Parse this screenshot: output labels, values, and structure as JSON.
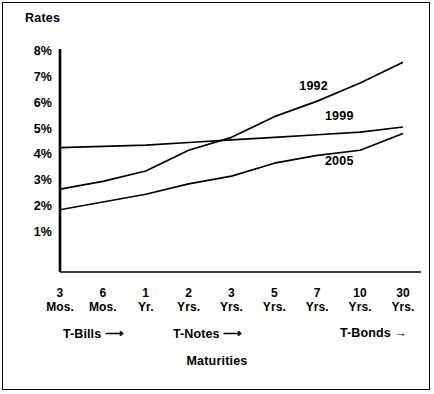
{
  "title": "YIELD CURVES FOR U.S. TREASURY SECURITIES",
  "axis": {
    "y_label": "Rates",
    "x_label": "Maturities"
  },
  "categories_markers": [
    {
      "label": "T-Bills",
      "arrow": "⟶"
    },
    {
      "label": "T-Notes",
      "arrow": "⟶"
    },
    {
      "label": "T-Bonds",
      "arrow": "→"
    }
  ],
  "chart_data": {
    "type": "line",
    "title": "YIELD CURVES FOR U.S. TREASURY SECURITIES",
    "xlabel": "Maturities",
    "ylabel": "Rates",
    "grid": false,
    "legend": "inline-labels",
    "categories": [
      "3 Mos.",
      "6 Mos.",
      "1 Yr.",
      "2 Yrs.",
      "3 Yrs.",
      "5 Yrs.",
      "7 Yrs.",
      "10 Yrs.",
      "30 Yrs."
    ],
    "ytick_labels": [
      "8%",
      "7%",
      "6%",
      "5%",
      "4%",
      "3%",
      "2%",
      "1%"
    ],
    "ytick_values": [
      8,
      7,
      6,
      5,
      4,
      3,
      2,
      1
    ],
    "ylim": [
      0,
      8.6
    ],
    "series": [
      {
        "name": "1992",
        "values": [
          2.7,
          3.0,
          3.4,
          4.2,
          4.7,
          5.5,
          6.1,
          6.8,
          7.6
        ]
      },
      {
        "name": "1999",
        "values": [
          4.3,
          4.35,
          4.4,
          4.5,
          4.6,
          4.7,
          4.8,
          4.9,
          5.1
        ]
      },
      {
        "name": "2005",
        "values": [
          1.9,
          2.2,
          2.5,
          2.9,
          3.2,
          3.7,
          4.0,
          4.2,
          4.85
        ]
      }
    ]
  }
}
